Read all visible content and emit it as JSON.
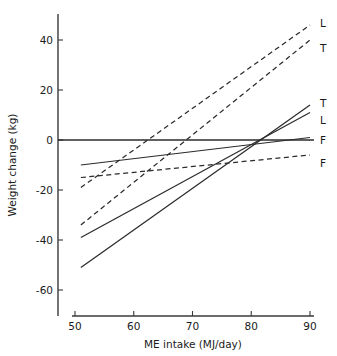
{
  "chart_data": {
    "type": "line",
    "title": "",
    "xlabel": "ME intake (MJ/day)",
    "ylabel": "Weight change (kg)",
    "xlim": [
      46,
      94
    ],
    "ylim": [
      -70,
      50
    ],
    "xticks": [
      50,
      60,
      70,
      80,
      90
    ],
    "xticklabels": [
      "50",
      "60",
      "70",
      "80",
      "90"
    ],
    "yticks": [
      40,
      20,
      0,
      -20,
      -40,
      -60
    ],
    "yticklabels": [
      "40",
      "20",
      "0",
      "-20",
      "-40",
      "-60"
    ],
    "grid": false,
    "legend_position": "right-inline-labels",
    "zero_reference_line": 0,
    "series": [
      {
        "name": "L-dashed",
        "label": "L",
        "style": "dashed",
        "x": [
          51,
          90
        ],
        "y": [
          -19,
          46
        ],
        "label_x": 90,
        "label_y": 47
      },
      {
        "name": "T-dashed",
        "label": "T",
        "style": "dashed",
        "x": [
          51,
          90
        ],
        "y": [
          -34,
          40
        ],
        "label_x": 90,
        "label_y": 37
      },
      {
        "name": "T-solid",
        "label": "T",
        "style": "solid",
        "x": [
          51,
          90
        ],
        "y": [
          -51,
          14
        ],
        "label_x": 90,
        "label_y": 15
      },
      {
        "name": "L-solid",
        "label": "L",
        "style": "solid",
        "x": [
          51,
          90
        ],
        "y": [
          -39,
          11
        ],
        "label_x": 90,
        "label_y": 8
      },
      {
        "name": "F-solid",
        "label": "F",
        "style": "solid",
        "x": [
          51,
          90
        ],
        "y": [
          -10,
          1
        ],
        "label_x": 90,
        "label_y": 0
      },
      {
        "name": "F-dashed",
        "label": "F",
        "style": "dashed",
        "x": [
          51,
          90
        ],
        "y": [
          -15,
          -6
        ],
        "label_x": 90,
        "label_y": -9
      }
    ]
  },
  "axes": {
    "x_axis_name": "ME intake (MJ/day)",
    "y_axis_name": "Weight change (kg)"
  }
}
